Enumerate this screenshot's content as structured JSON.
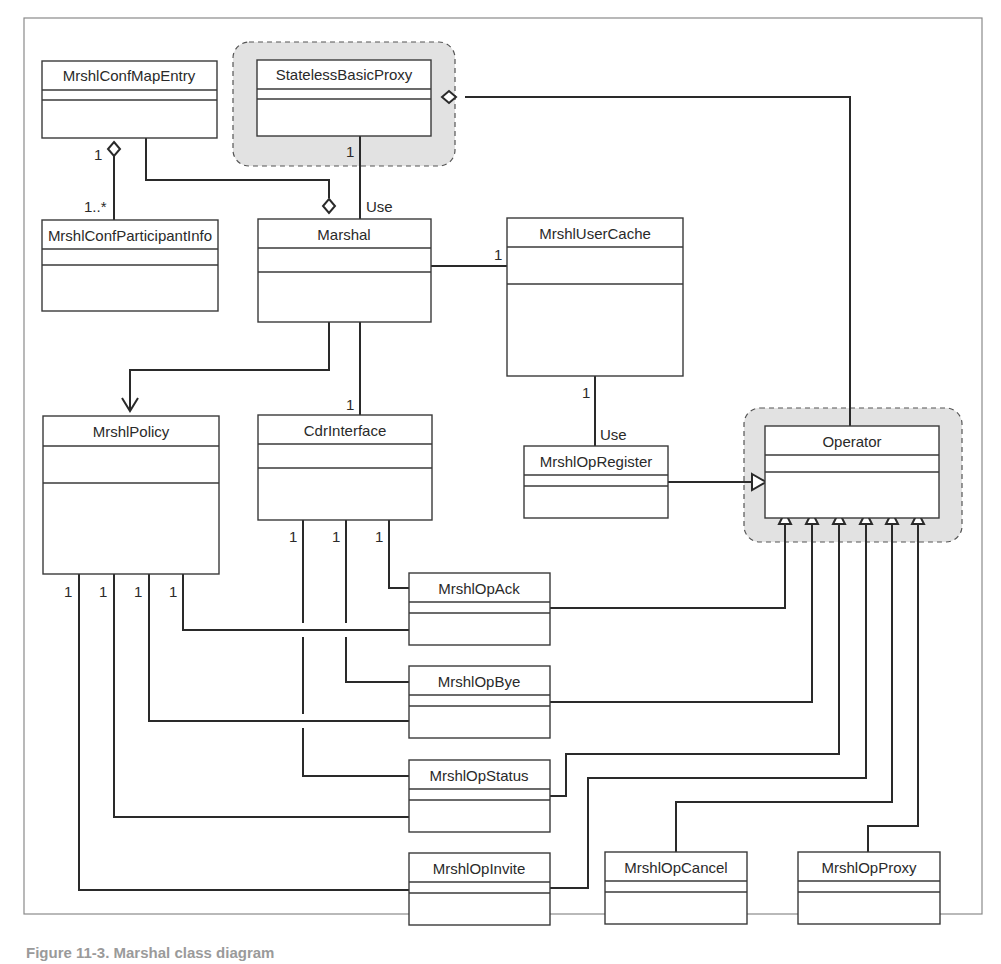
{
  "diagram": {
    "type": "UML class diagram",
    "highlight_color": "#e2e2e2",
    "line_color": "#2a2a2a",
    "highlighted_classes": [
      "StatelessBasicProxy",
      "Operator"
    ],
    "classes": {
      "conf_map_entry": "MrshlConfMapEntry",
      "stateless_basic_proxy": "StatelessBasicProxy",
      "conf_participant_info": "MrshlConfParticipantInfo",
      "marshal": "Marshal",
      "user_cache": "MrshlUserCache",
      "policy": "MrshlPolicy",
      "cdr_interface": "CdrInterface",
      "op_register": "MrshlOpRegister",
      "operator": "Operator",
      "op_ack": "MrshlOpAck",
      "op_bye": "MrshlOpBye",
      "op_status": "MrshlOpStatus",
      "op_invite": "MrshlOpInvite",
      "op_cancel": "MrshlOpCancel",
      "op_proxy": "MrshlOpProxy"
    },
    "labels": {
      "one": "1",
      "one_to_many": "1..*",
      "use": "Use"
    },
    "relationships": [
      {
        "from": "MrshlConfMapEntry",
        "to": "MrshlConfParticipantInfo",
        "type": "aggregation",
        "mult_from": "1",
        "mult_to": "1..*"
      },
      {
        "from": "Marshal",
        "to": "MrshlConfMapEntry",
        "type": "aggregation"
      },
      {
        "from": "StatelessBasicProxy",
        "to": "Marshal",
        "type": "association",
        "mult": "1",
        "label": "Use"
      },
      {
        "from": "StatelessBasicProxy",
        "to": "Operator",
        "type": "aggregation"
      },
      {
        "from": "Marshal",
        "to": "MrshlUserCache",
        "type": "association",
        "mult": "1"
      },
      {
        "from": "Marshal",
        "to": "MrshlPolicy",
        "type": "aggregation-navigable"
      },
      {
        "from": "Marshal",
        "to": "CdrInterface",
        "type": "association",
        "mult": "1"
      },
      {
        "from": "MrshlUserCache",
        "to": "MrshlOpRegister",
        "type": "association",
        "mult": "1",
        "label": "Use"
      },
      {
        "from": "MrshlOpRegister",
        "to": "Operator",
        "type": "generalization"
      },
      {
        "from": "MrshlOpAck",
        "to": "Operator",
        "type": "generalization"
      },
      {
        "from": "MrshlOpBye",
        "to": "Operator",
        "type": "generalization"
      },
      {
        "from": "MrshlOpStatus",
        "to": "Operator",
        "type": "generalization"
      },
      {
        "from": "MrshlOpInvite",
        "to": "Operator",
        "type": "generalization"
      },
      {
        "from": "MrshlOpCancel",
        "to": "Operator",
        "type": "generalization"
      },
      {
        "from": "MrshlOpProxy",
        "to": "Operator",
        "type": "generalization"
      },
      {
        "from": "MrshlPolicy",
        "to": "MrshlOpAck",
        "mult": "1"
      },
      {
        "from": "MrshlPolicy",
        "to": "MrshlOpBye",
        "mult": "1"
      },
      {
        "from": "MrshlPolicy",
        "to": "MrshlOpStatus",
        "mult": "1"
      },
      {
        "from": "MrshlPolicy",
        "to": "MrshlOpInvite",
        "mult": "1"
      },
      {
        "from": "CdrInterface",
        "to": "MrshlOpAck",
        "mult": "1"
      },
      {
        "from": "CdrInterface",
        "to": "MrshlOpBye",
        "mult": "1"
      },
      {
        "from": "CdrInterface",
        "to": "MrshlOpStatus",
        "mult": "1"
      }
    ]
  },
  "caption": "Figure 11-3. Marshal class diagram"
}
